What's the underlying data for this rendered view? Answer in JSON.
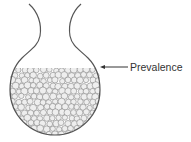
{
  "diagram": {
    "type": "flask-metaphor",
    "label": "Prevalence",
    "colors": {
      "outline": "#555555",
      "bead_fill": "#eeeeee",
      "bead_stroke": "#888888",
      "text": "#333333"
    },
    "flask": {
      "bulb_center": [
        55,
        90
      ],
      "bulb_radius": 45,
      "fill_level_y": 68
    },
    "arrow": {
      "from": [
        128,
        67
      ],
      "to": [
        100,
        67
      ]
    }
  }
}
